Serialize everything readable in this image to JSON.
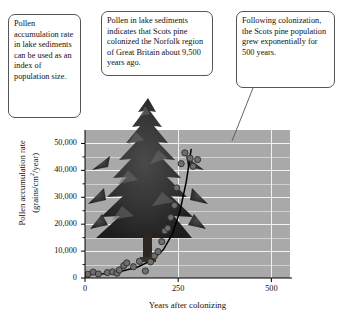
{
  "figure": {
    "callouts": [
      {
        "id": "pollen-index-note",
        "text": "Pollen accumulation rate in lake sediments can be used as an index of population size."
      },
      {
        "id": "colonization-date-note",
        "text": "Pollen in lake sediments indicates that Scots pine colonized the Norfolk region of Great Britain about 9,500 years ago."
      },
      {
        "id": "exponential-growth-note",
        "text": "Following colonization, the Scots pine population grew exponentially for 500 years."
      }
    ],
    "photo_caption": "scots-pine-tree"
  },
  "chart_data": {
    "type": "scatter",
    "title": "",
    "xlabel": "Years after colonizing",
    "ylabel_line1": "Pollen accumulation rate",
    "ylabel_line2_pre": "(grains/cm",
    "ylabel_line2_sup": "2",
    "ylabel_line2_post": "/year)",
    "xlim": [
      0,
      550
    ],
    "ylim": [
      0,
      55000
    ],
    "xticks": [
      0,
      250,
      500
    ],
    "xtick_labels": [
      "0",
      "250",
      "500"
    ],
    "yticks": [
      0,
      10000,
      20000,
      30000,
      40000,
      50000
    ],
    "ytick_labels": [
      "0",
      "10,000",
      "20,000",
      "30,000",
      "40,000",
      "50,000"
    ],
    "yminor_ticks": [
      5000,
      15000,
      25000,
      35000,
      45000
    ],
    "grid": "horizontal-and-vertical-white",
    "plot_background": "#a9a9a9",
    "point_color": "#6e6e6e",
    "point_edge_color": "#2b2b2b",
    "curve_color": "#000000",
    "legend": "none",
    "points": [
      {
        "x": 8,
        "y": 1400
      },
      {
        "x": 22,
        "y": 2200
      },
      {
        "x": 36,
        "y": 1500
      },
      {
        "x": 60,
        "y": 2000
      },
      {
        "x": 74,
        "y": 2300
      },
      {
        "x": 86,
        "y": 1800
      },
      {
        "x": 92,
        "y": 3000
      },
      {
        "x": 104,
        "y": 4600
      },
      {
        "x": 112,
        "y": 5600
      },
      {
        "x": 130,
        "y": 4200
      },
      {
        "x": 146,
        "y": 6200
      },
      {
        "x": 162,
        "y": 2600
      },
      {
        "x": 176,
        "y": 6000
      },
      {
        "x": 186,
        "y": 8200
      },
      {
        "x": 196,
        "y": 9800
      },
      {
        "x": 206,
        "y": 13500
      },
      {
        "x": 214,
        "y": 17500
      },
      {
        "x": 222,
        "y": 18500
      },
      {
        "x": 230,
        "y": 22500
      },
      {
        "x": 240,
        "y": 27000
      },
      {
        "x": 246,
        "y": 33500
      },
      {
        "x": 258,
        "y": 42500
      },
      {
        "x": 268,
        "y": 46500
      },
      {
        "x": 282,
        "y": 44500
      },
      {
        "x": 290,
        "y": 41500
      },
      {
        "x": 302,
        "y": 44000
      }
    ],
    "fit_curve": {
      "description": "exponential growth fit",
      "points": [
        {
          "x": 0,
          "y": 1200
        },
        {
          "x": 50,
          "y": 1600
        },
        {
          "x": 100,
          "y": 2600
        },
        {
          "x": 140,
          "y": 4000
        },
        {
          "x": 180,
          "y": 6600
        },
        {
          "x": 210,
          "y": 10500
        },
        {
          "x": 235,
          "y": 16500
        },
        {
          "x": 255,
          "y": 25000
        },
        {
          "x": 272,
          "y": 36000
        },
        {
          "x": 285,
          "y": 48000
        }
      ]
    }
  }
}
